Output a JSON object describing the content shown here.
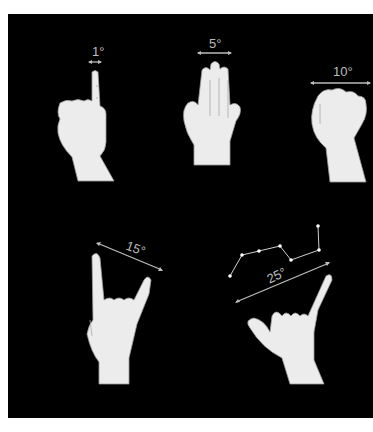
{
  "figure": {
    "background_color": "#000000",
    "label_color": "#bdbdbd",
    "hand_color": "#ececec",
    "gestures": [
      {
        "name": "one-finger",
        "angle_label": "1°",
        "angle_deg": 1
      },
      {
        "name": "three-fingers",
        "angle_label": "5°",
        "angle_deg": 5
      },
      {
        "name": "fist",
        "angle_label": "10°",
        "angle_deg": 10
      },
      {
        "name": "horns",
        "angle_label": "15°",
        "angle_deg": 15
      },
      {
        "name": "shaka",
        "angle_label": "25°",
        "angle_deg": 25
      }
    ],
    "constellation_stars": 7
  },
  "caption": {
    "text": "",
    "note_visible": "caption text cut off at bottom edge"
  }
}
